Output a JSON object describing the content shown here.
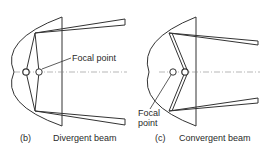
{
  "diagrams": [
    {
      "id": "b",
      "letter": "(b)",
      "caption": "Divergent beam",
      "annotation": "Focal point"
    },
    {
      "id": "c",
      "letter": "(c)",
      "caption": "Convergent beam",
      "annotation_line1": "Focal",
      "annotation_line2": "point"
    }
  ],
  "colors": {
    "line": "#333333",
    "axis": "#777777",
    "background": "#ffffff"
  }
}
